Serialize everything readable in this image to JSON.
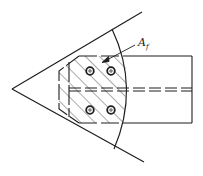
{
  "diagram": {
    "type": "gusset-plate-connection",
    "label": {
      "main": "A",
      "subscript": "f"
    },
    "colors": {
      "stroke": "#1e1e1e",
      "background": "#ffffff"
    },
    "bolt_count": 4
  }
}
